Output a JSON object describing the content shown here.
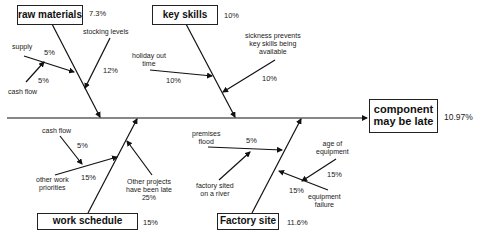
{
  "effect": {
    "label": "component may be late",
    "line1": "component",
    "line2": "may be late",
    "percent": "10.97%"
  },
  "categories": {
    "raw_materials": {
      "label": "raw materials",
      "percent": "7.3%",
      "causes": [
        {
          "label": "supply",
          "percent": "5%"
        },
        {
          "label": "cash flow",
          "percent": "5%"
        },
        {
          "label": "stocking levels",
          "percent": "12%"
        }
      ]
    },
    "key_skills": {
      "label": "key skills",
      "percent": "10%",
      "causes": [
        {
          "label": "holiday out time",
          "line1": "holiday out",
          "line2": "time",
          "percent": "10%"
        },
        {
          "label": "sickness prevents key skills being available",
          "line1": "sickness prevents",
          "line2": "key skills being",
          "line3": "available",
          "percent": "10%"
        }
      ]
    },
    "work_schedule": {
      "label": "work schedule",
      "percent": "15%",
      "causes": [
        {
          "label": "cash flow",
          "percent": "5%"
        },
        {
          "label": "other work priorities",
          "line1": "other work",
          "line2": "priorities",
          "percent": "15%"
        },
        {
          "label": "Other projects have been late",
          "line1": "Other projects",
          "line2": "have been late",
          "percent": "25%"
        }
      ]
    },
    "factory_site": {
      "label": "Factory site",
      "percent": "11.6%",
      "causes": [
        {
          "label": "premises flood",
          "line1": "premises",
          "line2": "flood",
          "percent": "5%"
        },
        {
          "label": "factory sited on a river",
          "line1": "factory sited",
          "line2": "on a river",
          "percent": ""
        },
        {
          "label": "age of equipment",
          "line1": "age of",
          "line2": "equipment",
          "percent": "15%"
        },
        {
          "label": "equipment failure",
          "line1": "equipment",
          "line2": "failure",
          "percent": "15%"
        }
      ]
    }
  },
  "colors": {
    "line": "#111111",
    "box_border": "#222222",
    "background": "#ffffff"
  }
}
